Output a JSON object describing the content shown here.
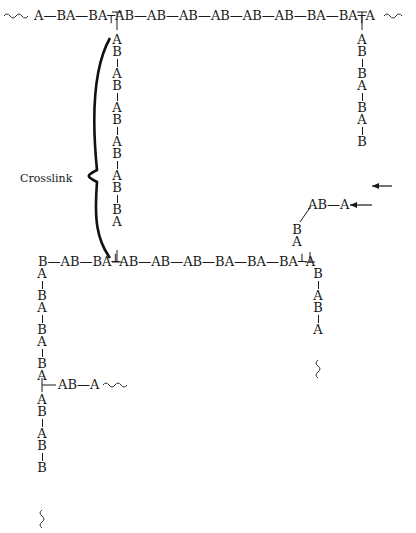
{
  "diagram": {
    "top_chain": "A—BA—BA┬AB—AB—AB—AB—AB—AB—BA—BA┬A",
    "top_chain_units": [
      "A",
      "BA",
      "BA",
      "AB",
      "AB",
      "AB",
      "AB",
      "AB",
      "AB",
      "BA",
      "BA",
      "A"
    ],
    "crosslink_label": "Crosslink",
    "crosslink_units": [
      "A",
      "B",
      "A",
      "B",
      "A",
      "B",
      "A",
      "B",
      "A",
      "B",
      "B",
      "A"
    ],
    "top_right_branch_units": [
      "A",
      "B",
      "B",
      "A",
      "B",
      "A",
      "B"
    ],
    "middle_chain": "B—AB—BA┴AB—AB—AB—BA—BA—BA┴A",
    "middle_chain_units": [
      "B",
      "AB",
      "BA",
      "AB",
      "AB",
      "AB",
      "BA",
      "BA",
      "BA",
      "A"
    ],
    "upper_branch": "AB—A",
    "upper_branch_units": [
      "B",
      "A"
    ],
    "lower_right_branch_units": [
      "B",
      "A",
      "B",
      "A"
    ],
    "left_branch_units": [
      "A",
      "B",
      "A",
      "B",
      "A",
      "B",
      "A"
    ],
    "left_side_chain": "AB—A",
    "left_lower_units": [
      "A",
      "B",
      "A",
      "B",
      "B"
    ],
    "wavy": "〰"
  },
  "colors": {
    "ink": "#1a1a1a",
    "background": "#ffffff"
  }
}
